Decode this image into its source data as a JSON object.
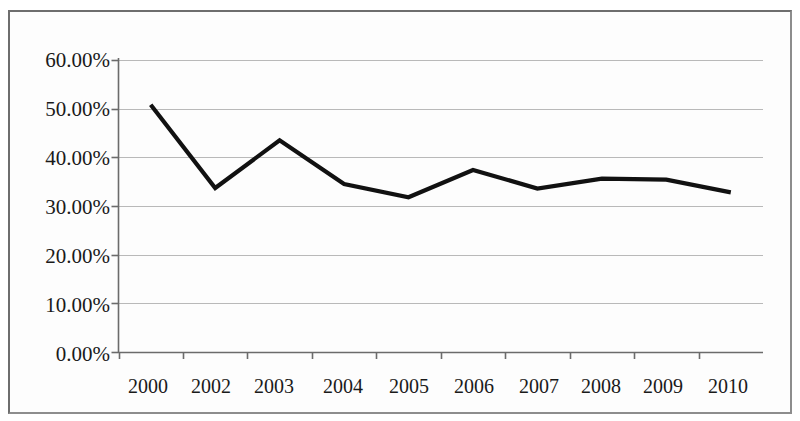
{
  "chart_data": {
    "type": "line",
    "title": "",
    "subtitle": "",
    "xlabel": "",
    "ylabel": "",
    "categories": [
      "2000",
      "2002",
      "2003",
      "2004",
      "2005",
      "2006",
      "2007",
      "2008",
      "2009",
      "2010"
    ],
    "values": [
      50.8,
      33.7,
      43.5,
      34.5,
      31.8,
      37.4,
      33.6,
      35.6,
      35.4,
      32.8
    ],
    "series": [
      {
        "name": "",
        "values": [
          50.8,
          33.7,
          43.5,
          34.5,
          31.8,
          37.4,
          33.6,
          35.6,
          35.4,
          32.8
        ]
      }
    ],
    "y_tick_labels": [
      "60.00%",
      "50.00%",
      "40.00%",
      "30.00%",
      "20.00%",
      "10.00%",
      "0.00%"
    ],
    "y_tick_values": [
      60,
      50,
      40,
      30,
      20,
      10,
      0
    ],
    "ylim": [
      0,
      60
    ],
    "grid": "horizontal",
    "legend": "none",
    "line_color": "#111111",
    "gridline_color": "#b9b9b9",
    "axis_color": "#6b6b6b",
    "markers": "none",
    "value_format": "percent"
  },
  "figure": {
    "border_color": "#6e6e6e",
    "background_color": "#fdfdfd"
  }
}
